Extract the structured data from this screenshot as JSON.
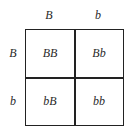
{
  "punnett_square": {
    "column_headers": [
      "B",
      "b"
    ],
    "row_headers": [
      "B",
      "b"
    ],
    "cells": [
      [
        "BB",
        "Bb"
      ],
      [
        "bB",
        "bb"
      ]
    ]
  }
}
